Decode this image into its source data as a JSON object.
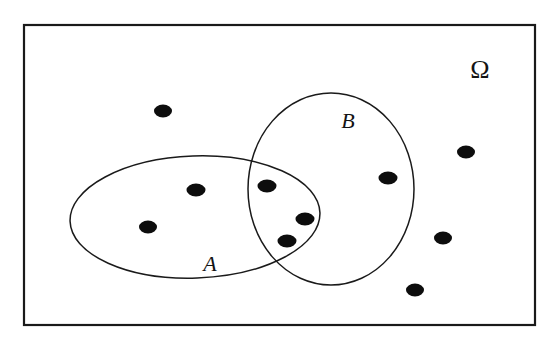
{
  "figure": {
    "type": "venn-diagram",
    "background_color": "#ffffff",
    "stroke_color": "#1a1a1a",
    "point_color": "#0d0d0d",
    "width": 556,
    "height": 342
  },
  "universe": {
    "name": "universe-rectangle",
    "label": "Ω",
    "label_x": 480,
    "label_y": 72,
    "label_size": 26,
    "x": 24,
    "y": 25,
    "width": 511,
    "height": 300,
    "stroke_width": 2.2
  },
  "sets": [
    {
      "id": "A",
      "label": "A",
      "shape": "ellipse",
      "cx": 195,
      "cy": 217,
      "rx": 125,
      "ry": 61,
      "rotation": -2,
      "label_x": 210,
      "label_y": 266,
      "label_size": 22,
      "stroke_width": 1.5
    },
    {
      "id": "B",
      "label": "B",
      "shape": "ellipse",
      "cx": 331,
      "cy": 189,
      "rx": 83,
      "ry": 96,
      "rotation": 0,
      "label_x": 348,
      "label_y": 123,
      "label_size": 22,
      "stroke_width": 1.5
    }
  ],
  "points": [
    {
      "id": "p1",
      "cx": 163,
      "cy": 111,
      "rx": 9,
      "ry": 6.5,
      "region": "outside"
    },
    {
      "id": "p2",
      "cx": 196,
      "cy": 190,
      "rx": 9.5,
      "ry": 6.5,
      "region": "A-only"
    },
    {
      "id": "p3",
      "cx": 148,
      "cy": 227,
      "rx": 9,
      "ry": 6.5,
      "region": "A-only"
    },
    {
      "id": "p4",
      "cx": 267,
      "cy": 186,
      "rx": 9.5,
      "ry": 6.5,
      "region": "A-and-B"
    },
    {
      "id": "p5",
      "cx": 305,
      "cy": 219,
      "rx": 9.5,
      "ry": 6.5,
      "region": "A-and-B"
    },
    {
      "id": "p6",
      "cx": 287,
      "cy": 241,
      "rx": 9.5,
      "ry": 6.5,
      "region": "A-and-B"
    },
    {
      "id": "p7",
      "cx": 388,
      "cy": 178,
      "rx": 9.5,
      "ry": 6.5,
      "region": "B-only"
    },
    {
      "id": "p8",
      "cx": 466,
      "cy": 152,
      "rx": 9,
      "ry": 6.5,
      "region": "outside"
    },
    {
      "id": "p9",
      "cx": 443,
      "cy": 238,
      "rx": 9,
      "ry": 6.5,
      "region": "outside"
    },
    {
      "id": "p10",
      "cx": 415,
      "cy": 290,
      "rx": 9,
      "ry": 6.5,
      "region": "outside"
    }
  ],
  "counts": {
    "total_points": 10,
    "a_only": 2,
    "b_only": 1,
    "intersection": 3,
    "outside": 4
  }
}
